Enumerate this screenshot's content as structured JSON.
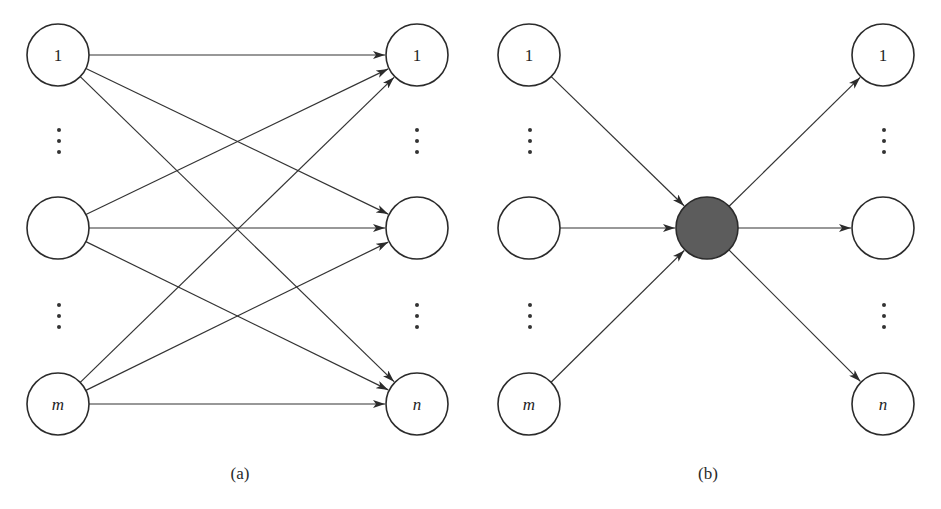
{
  "figure": {
    "colors": {
      "stroke": "#333333",
      "node_stroke": "#2b2b2b",
      "hub_fill": "#5c5c5c",
      "node_fill": "#ffffff",
      "text": "#1e1e1e"
    },
    "node_radius": 31,
    "panels": [
      {
        "id": "a",
        "caption": "(a)",
        "caption_pos": [
          240,
          473
        ],
        "nodes": [
          {
            "id": "L1",
            "label": "1",
            "italic": false,
            "x": 58,
            "y": 55
          },
          {
            "id": "Lmid",
            "label": "",
            "italic": false,
            "x": 58,
            "y": 228
          },
          {
            "id": "Lm",
            "label": "m",
            "italic": true,
            "x": 58,
            "y": 404
          },
          {
            "id": "R1",
            "label": "1",
            "italic": false,
            "x": 417,
            "y": 55
          },
          {
            "id": "Rmid",
            "label": "",
            "italic": false,
            "x": 417,
            "y": 228
          },
          {
            "id": "Rn",
            "label": "n",
            "italic": true,
            "x": 417,
            "y": 404
          }
        ],
        "edges": [
          [
            "L1",
            "R1"
          ],
          [
            "L1",
            "Rmid"
          ],
          [
            "L1",
            "Rn"
          ],
          [
            "Lmid",
            "R1"
          ],
          [
            "Lmid",
            "Rmid"
          ],
          [
            "Lmid",
            "Rn"
          ],
          [
            "Lm",
            "R1"
          ],
          [
            "Lm",
            "Rmid"
          ],
          [
            "Lm",
            "Rn"
          ]
        ],
        "ellipses": [
          {
            "x": 59,
            "y": 141
          },
          {
            "x": 59,
            "y": 316
          },
          {
            "x": 417,
            "y": 141
          },
          {
            "x": 417,
            "y": 316
          }
        ]
      },
      {
        "id": "b",
        "caption": "(b)",
        "caption_pos": [
          708,
          473
        ],
        "nodes": [
          {
            "id": "L1",
            "label": "1",
            "italic": false,
            "x": 529,
            "y": 55
          },
          {
            "id": "Lmid",
            "label": "",
            "italic": false,
            "x": 529,
            "y": 228
          },
          {
            "id": "Lm",
            "label": "m",
            "italic": true,
            "x": 529,
            "y": 404
          },
          {
            "id": "HUB",
            "label": "",
            "italic": false,
            "x": 707,
            "y": 228,
            "filled": true
          },
          {
            "id": "R1",
            "label": "1",
            "italic": false,
            "x": 883,
            "y": 55
          },
          {
            "id": "Rmid",
            "label": "",
            "italic": false,
            "x": 883,
            "y": 228
          },
          {
            "id": "Rn",
            "label": "n",
            "italic": true,
            "x": 883,
            "y": 404
          }
        ],
        "edges": [
          [
            "L1",
            "HUB"
          ],
          [
            "Lmid",
            "HUB"
          ],
          [
            "Lm",
            "HUB"
          ],
          [
            "HUB",
            "R1"
          ],
          [
            "HUB",
            "Rmid"
          ],
          [
            "HUB",
            "Rn"
          ]
        ],
        "ellipses": [
          {
            "x": 530,
            "y": 141
          },
          {
            "x": 530,
            "y": 316
          },
          {
            "x": 884,
            "y": 141
          },
          {
            "x": 884,
            "y": 316
          }
        ]
      }
    ]
  }
}
